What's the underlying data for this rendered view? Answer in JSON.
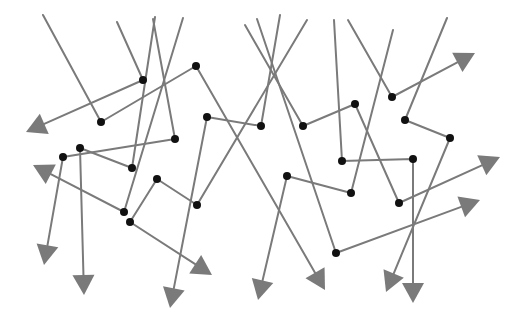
{
  "diagram": {
    "title": "",
    "colors": {
      "line": "#7a7a7a",
      "node": "#111111",
      "arrowhead": "#7a7a7a",
      "background": "#ffffff"
    },
    "paths": [
      {
        "id": "p1",
        "points": [
          [
            117,
            22
          ],
          [
            143,
            80
          ],
          [
            26,
            132
          ]
        ],
        "nodes": [
          1
        ]
      },
      {
        "id": "p2",
        "points": [
          [
            43,
            15
          ],
          [
            101,
            122
          ],
          [
            196,
            66
          ],
          [
            325,
            290
          ]
        ],
        "nodes": [
          1,
          2
        ]
      },
      {
        "id": "p3",
        "points": [
          [
            183,
            18
          ],
          [
            124,
            212
          ],
          [
            33,
            165
          ]
        ],
        "nodes": [
          1
        ]
      },
      {
        "id": "p4",
        "points": [
          [
            153,
            19
          ],
          [
            175,
            139
          ],
          [
            63,
            157
          ],
          [
            44,
            265
          ]
        ],
        "nodes": [
          1,
          2
        ]
      },
      {
        "id": "p5",
        "points": [
          [
            155,
            17
          ],
          [
            132,
            168
          ],
          [
            80,
            148
          ],
          [
            84,
            295
          ]
        ],
        "nodes": [
          1,
          2
        ]
      },
      {
        "id": "p6",
        "points": [
          [
            307,
            20
          ],
          [
            197,
            205
          ],
          [
            157,
            179
          ],
          [
            130,
            222
          ],
          [
            212,
            275
          ]
        ],
        "nodes": [
          1,
          2,
          3
        ]
      },
      {
        "id": "p7",
        "points": [
          [
            280,
            15
          ],
          [
            261,
            126
          ],
          [
            207,
            117
          ],
          [
            170,
            308
          ]
        ],
        "nodes": [
          1,
          2
        ]
      },
      {
        "id": "p8",
        "points": [
          [
            245,
            25
          ],
          [
            303,
            126
          ],
          [
            355,
            104
          ],
          [
            399,
            203
          ],
          [
            500,
            157
          ]
        ],
        "nodes": [
          1,
          2,
          3
        ]
      },
      {
        "id": "p9",
        "points": [
          [
            257,
            19
          ],
          [
            336,
            253
          ],
          [
            480,
            200
          ]
        ],
        "nodes": [
          1
        ]
      },
      {
        "id": "p10",
        "points": [
          [
            334,
            20
          ],
          [
            342,
            161
          ],
          [
            413,
            159
          ],
          [
            413,
            303
          ]
        ],
        "nodes": [
          1,
          2
        ]
      },
      {
        "id": "p11",
        "points": [
          [
            348,
            20
          ],
          [
            392,
            97
          ],
          [
            475,
            53
          ]
        ],
        "nodes": [
          1
        ]
      },
      {
        "id": "p12",
        "points": [
          [
            447,
            18
          ],
          [
            405,
            120
          ],
          [
            450,
            138
          ],
          [
            386,
            292
          ]
        ],
        "nodes": [
          1,
          2
        ]
      },
      {
        "id": "p13",
        "points": [
          [
            393,
            30
          ],
          [
            351,
            193
          ],
          [
            287,
            176
          ],
          [
            258,
            300
          ]
        ],
        "nodes": [
          1,
          2
        ]
      }
    ]
  }
}
